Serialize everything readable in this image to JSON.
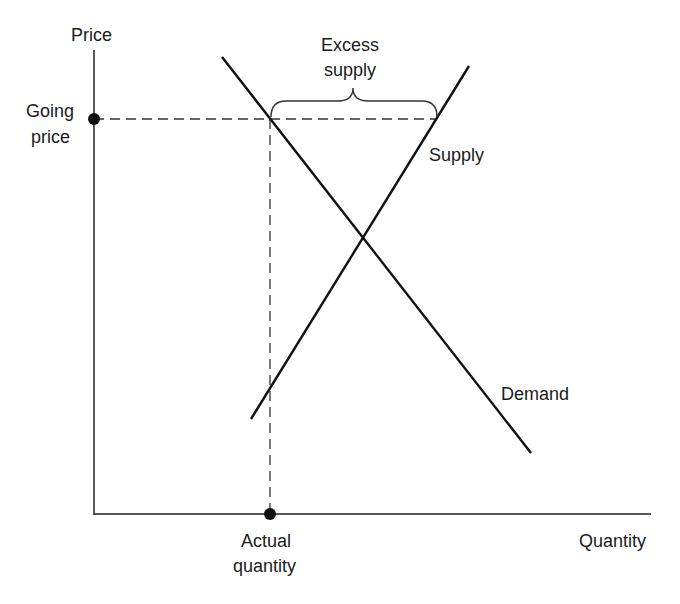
{
  "diagram": {
    "axes": {
      "y_label": "Price",
      "x_label": "Quantity"
    },
    "curves": [
      {
        "name": "Demand",
        "label": "Demand"
      },
      {
        "name": "Supply",
        "label": "Supply"
      }
    ],
    "annotations": {
      "going_price_line1": "Going",
      "going_price_line2": "price",
      "actual_quantity_line1": "Actual",
      "actual_quantity_line2": "quantity",
      "excess_supply_line1": "Excess",
      "excess_supply_line2": "supply"
    }
  }
}
